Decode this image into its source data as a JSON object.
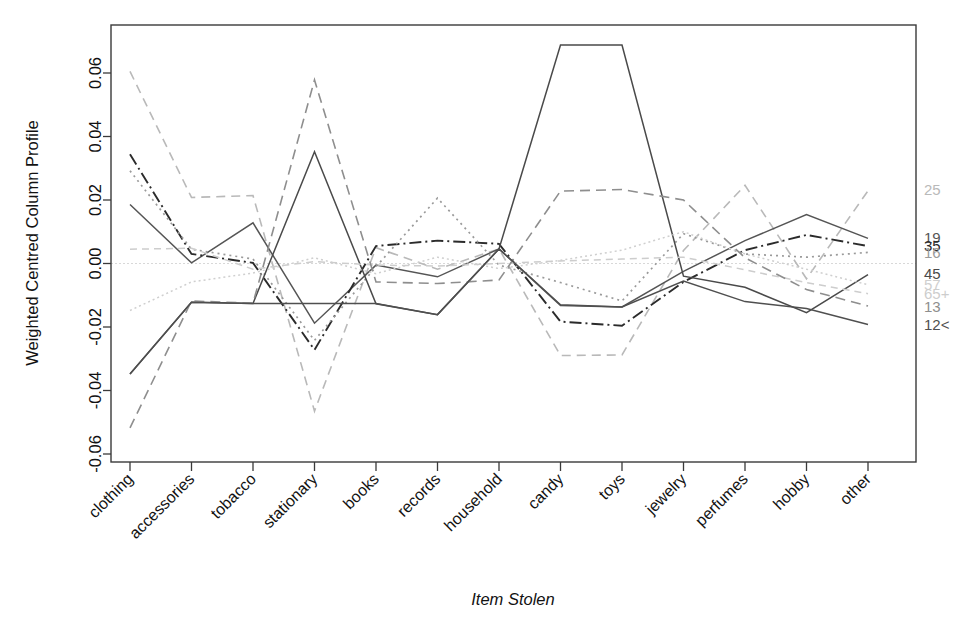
{
  "chart_data": {
    "type": "line",
    "title": "",
    "xlabel": "Item Stolen",
    "ylabel": "Weighted Centred Column Profile",
    "categories": [
      "clothing",
      "accessories",
      "tobacco",
      "stationary",
      "books",
      "records",
      "household",
      "candy",
      "toys",
      "jewelry",
      "perfumes",
      "hobby",
      "other"
    ],
    "ylim": [
      -0.068,
      0.072
    ],
    "yticks": [
      0.06,
      0.04,
      0.02,
      0.0,
      -0.02,
      -0.04,
      -0.06
    ],
    "ytick_labels": [
      "0.06",
      "0.04",
      "0.02",
      "0.00",
      "-0.02",
      "-0.04",
      "-0.06"
    ],
    "grid": false,
    "legend_position": "right",
    "series": [
      {
        "name": "25",
        "label": "25",
        "color": "#b9b9b9",
        "dash": "9 6",
        "width": 1.6,
        "legend_y": 0.0232,
        "values": [
          0.0605,
          0.0208,
          0.0214,
          -0.0465,
          0.005,
          -0.0018,
          0.0046,
          -0.029,
          -0.0288,
          0.0041,
          0.0246,
          -0.0048,
          0.0229
        ]
      },
      {
        "name": "19",
        "label": "19",
        "color": "#555555",
        "dash": "none",
        "width": 1.5,
        "legend_y": 0.0082,
        "values": [
          0.0186,
          0.0002,
          0.0128,
          -0.0188,
          -0.0005,
          -0.0042,
          0.0046,
          -0.0132,
          -0.0137,
          -0.0025,
          0.0072,
          0.0154,
          0.0079
        ]
      },
      {
        "name": "35",
        "label": "35",
        "color": "#2b2b2b",
        "dash": "12 4 2 4",
        "width": 1.9,
        "legend_y": 0.0057,
        "values": [
          0.0344,
          0.003,
          0.0002,
          -0.0272,
          0.0055,
          0.0072,
          0.0062,
          -0.0183,
          -0.0196,
          -0.0058,
          0.0042,
          0.009,
          0.0055
        ]
      },
      {
        "name": "16",
        "label": "16",
        "color": "#9a9a9a",
        "dash": "2 4",
        "width": 1.7,
        "legend_y": 0.0035,
        "values": [
          0.0292,
          0.0045,
          0.0014,
          -0.0242,
          -0.001,
          0.0206,
          -0.0005,
          -0.006,
          -0.0118,
          0.0094,
          0.003,
          0.002,
          0.0035
        ]
      },
      {
        "name": "45",
        "label": "45",
        "color": "#4a4a4a",
        "dash": "none",
        "width": 1.5,
        "legend_y": -0.0031,
        "values": [
          -0.0348,
          -0.0122,
          -0.0126,
          0.0352,
          -0.0127,
          -0.0161,
          0.0046,
          0.0688,
          0.0688,
          -0.004,
          -0.0075,
          -0.0155,
          -0.0035
        ]
      },
      {
        "name": "57",
        "label": "57",
        "color": "#cfcfcf",
        "dash": "2 3",
        "width": 1.5,
        "legend_y": -0.0067,
        "values": [
          -0.0148,
          -0.0058,
          -0.003,
          0.0018,
          -0.0032,
          0.002,
          -0.0016,
          0.001,
          0.0042,
          0.01,
          0.003,
          -0.0018,
          -0.0067
        ]
      },
      {
        "name": "65+",
        "label": "65+",
        "color": "#cdcdcd",
        "dash": "7 5",
        "width": 1.5,
        "legend_y": -0.0095,
        "values": [
          0.0045,
          0.0048,
          -0.0018,
          0.0006,
          -0.0005,
          -0.0008,
          0.0,
          0.0008,
          0.0014,
          0.002,
          -0.002,
          -0.006,
          -0.0095
        ]
      },
      {
        "name": "13",
        "label": "13",
        "color": "#8e8e8e",
        "dash": "10 6",
        "width": 1.6,
        "legend_y": -0.0134,
        "values": [
          -0.0518,
          -0.0118,
          -0.0125,
          0.0578,
          -0.0058,
          -0.0063,
          -0.0052,
          0.0228,
          0.0233,
          0.02,
          0.0018,
          -0.0082,
          -0.0134
        ]
      },
      {
        "name": "12<",
        "label": "12<",
        "color": "#4f4f4f",
        "dash": "none",
        "width": 1.5,
        "legend_y": -0.0192,
        "values": [
          -0.0348,
          -0.0122,
          -0.0126,
          -0.0126,
          -0.0126,
          -0.0161,
          0.0046,
          -0.013,
          -0.0137,
          -0.0055,
          -0.012,
          -0.0142,
          -0.0192
        ]
      }
    ]
  },
  "legend": {
    "labels": [
      "25",
      "19",
      "35",
      "16",
      "45",
      "57",
      "65+",
      "13",
      "12<"
    ]
  }
}
